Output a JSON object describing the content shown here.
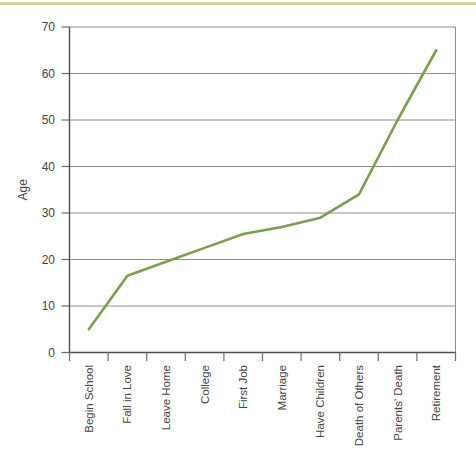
{
  "page": {
    "top_rule_color": "#cbd5a0"
  },
  "chart_data": {
    "type": "line",
    "title": "",
    "xlabel": "",
    "ylabel": "Age",
    "categories": [
      "Begin School",
      "Fall in Love",
      "Leave Home",
      "College",
      "First Job",
      "Marriage",
      "Have Children",
      "Death of Others",
      "Parents' Death",
      "Retirement"
    ],
    "values": [
      5,
      16.5,
      19.5,
      22.5,
      25.5,
      27,
      29,
      34,
      50,
      65
    ],
    "ylim": [
      0,
      70
    ],
    "y_ticks": [
      0,
      10,
      20,
      30,
      40,
      50,
      60,
      70
    ],
    "grid": "horizontal-on",
    "legend": "none",
    "x_label_rotation_deg": 90,
    "colors": {
      "line": "#78a04f",
      "grid": "#8e8e8e",
      "axis": "#4f4f4f",
      "tick": "#6a6a6a",
      "text": "#454545",
      "right_border": "#8e8e8e"
    }
  }
}
